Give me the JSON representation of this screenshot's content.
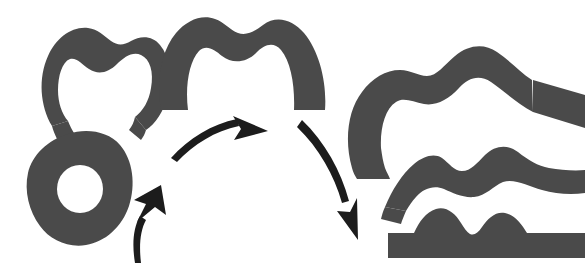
{
  "figure": {
    "background_color": "#ffffff",
    "shape_color": "#4a4a4a",
    "arrow_color": "#1c1c1c",
    "canvas": {
      "width": 585,
      "height": 268
    }
  },
  "groups": [
    {
      "id": "left-group",
      "label": "Left group",
      "shapes": [
        {
          "id": "omega-horseshoe",
          "name": "omega-horseshoe-shape",
          "description": "Open horseshoe / omega ring with bumpy upper outline and two downward legs",
          "genus": 0,
          "holes": 0
        },
        {
          "id": "blob-with-hole",
          "name": "blob-with-hole-shape",
          "description": "Irregular rounded blob containing one circular hole",
          "genus": 1,
          "holes": 1
        }
      ]
    },
    {
      "id": "middle-group",
      "label": "Middle group",
      "shapes": [
        {
          "id": "arch-band",
          "name": "arch-band-shape",
          "description": "Thick inverted-U arch band with a gentle dip along the top outline",
          "genus": 0,
          "holes": 0
        }
      ]
    },
    {
      "id": "right-group",
      "label": "Right group",
      "shapes": [
        {
          "id": "swoosh-band",
          "name": "swoosh-band-shape",
          "description": "Large curved swoosh band opening to the right, wavy top edge, running off the right edge",
          "genus": 0,
          "holes": 0
        },
        {
          "id": "wavy-curved-band",
          "name": "wavy-curved-band-shape",
          "description": "Gently arched band with two rounded bumps along its top edge",
          "genus": 0,
          "holes": 0
        },
        {
          "id": "wavy-flat-band",
          "name": "wavy-flat-band-shape",
          "description": "Flat-bottomed rectangular band with two rounded bumps along its top edge",
          "genus": 0,
          "holes": 0
        }
      ]
    }
  ],
  "arrows": [
    {
      "id": "arrow-small-up",
      "name": "small-curved-up-arrow",
      "direction": "up-right",
      "style": "curved",
      "from_group": "left-group",
      "to_group": "middle-group"
    },
    {
      "id": "arrow-large-up",
      "name": "large-curved-up-right-arrow",
      "direction": "up-right",
      "style": "curved",
      "from_group": "left-group",
      "to_group": "middle-group"
    },
    {
      "id": "arrow-large-down",
      "name": "large-curved-down-right-arrow",
      "direction": "down-right",
      "style": "curved",
      "from_group": "middle-group",
      "to_group": "right-group"
    }
  ]
}
